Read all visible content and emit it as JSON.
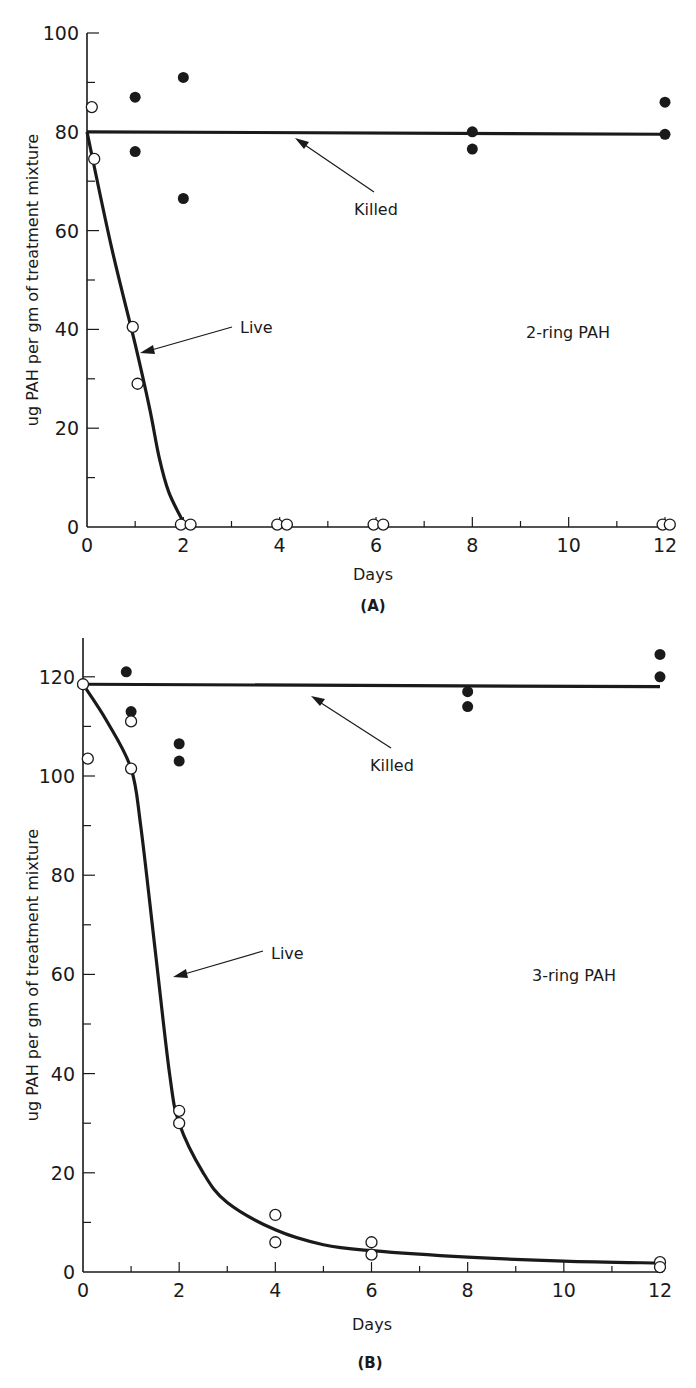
{
  "chart_data": [
    {
      "panel": "(A)",
      "type": "scatter",
      "title": "2-ring PAH",
      "xlabel": "Days",
      "ylabel": "ug PAH per gm of treatment mixture",
      "xlim": [
        0,
        12
      ],
      "ylim": [
        0,
        100
      ],
      "x_ticks": [
        0,
        2,
        4,
        6,
        8,
        10,
        12
      ],
      "y_ticks": [
        0,
        20,
        40,
        60,
        80,
        100
      ],
      "grid": false,
      "annotations": [
        "Killed",
        "Live",
        "2-ring PAH"
      ],
      "series": [
        {
          "name": "Killed",
          "marker": "filled-circle",
          "points": [
            [
              1,
              87
            ],
            [
              1,
              76
            ],
            [
              2,
              91
            ],
            [
              2,
              66.5
            ],
            [
              8,
              80
            ],
            [
              8,
              76.5
            ],
            [
              12,
              86
            ],
            [
              12,
              79.5
            ]
          ],
          "fit_line": [
            [
              0,
              80
            ],
            [
              12,
              79.5
            ]
          ]
        },
        {
          "name": "Live",
          "marker": "open-circle",
          "points": [
            [
              0.1,
              85
            ],
            [
              0.15,
              74.5
            ],
            [
              0.95,
              40.5
            ],
            [
              1.05,
              29
            ],
            [
              1.95,
              0.5
            ],
            [
              2.15,
              0.5
            ],
            [
              3.95,
              0.5
            ],
            [
              4.15,
              0.5
            ],
            [
              5.95,
              0.5
            ],
            [
              6.15,
              0.5
            ],
            [
              11.95,
              0.5
            ],
            [
              12.1,
              0.5
            ]
          ],
          "fit_line": [
            [
              0,
              80
            ],
            [
              0.5,
              57
            ],
            [
              1,
              37
            ],
            [
              1.3,
              24
            ],
            [
              1.5,
              14
            ],
            [
              1.7,
              7
            ],
            [
              2,
              1
            ]
          ]
        }
      ]
    },
    {
      "panel": "(B)",
      "type": "scatter",
      "title": "3-ring PAH",
      "xlabel": "Days",
      "ylabel": "ug PAH per gm of treatment mixture",
      "xlim": [
        0,
        12
      ],
      "ylim": [
        0,
        128
      ],
      "x_ticks": [
        0,
        2,
        4,
        6,
        8,
        10,
        12
      ],
      "y_ticks": [
        0,
        20,
        40,
        60,
        80,
        100,
        120
      ],
      "grid": false,
      "annotations": [
        "Killed",
        "Live",
        "3-ring PAH"
      ],
      "series": [
        {
          "name": "Killed",
          "marker": "filled-circle",
          "points": [
            [
              0.9,
              121
            ],
            [
              1,
              113
            ],
            [
              2,
              106.5
            ],
            [
              2,
              103
            ],
            [
              8,
              117
            ],
            [
              8,
              114
            ],
            [
              12,
              124.5
            ],
            [
              12,
              120
            ]
          ],
          "fit_line": [
            [
              0,
              118.5
            ],
            [
              12,
              118
            ]
          ]
        },
        {
          "name": "Live",
          "marker": "open-circle",
          "points": [
            [
              0,
              118.5
            ],
            [
              0.1,
              103.5
            ],
            [
              1,
              111
            ],
            [
              1,
              101.5
            ],
            [
              2,
              32.5
            ],
            [
              2,
              30
            ],
            [
              4,
              11.5
            ],
            [
              4,
              6
            ],
            [
              6,
              6
            ],
            [
              6,
              3.5
            ],
            [
              12,
              2
            ],
            [
              12,
              1
            ]
          ],
          "fit_line": [
            [
              0,
              118.5
            ],
            [
              0.5,
              111
            ],
            [
              1,
              101.5
            ],
            [
              1.2,
              90
            ],
            [
              1.5,
              65
            ],
            [
              1.8,
              40
            ],
            [
              2,
              30
            ],
            [
              2.5,
              20
            ],
            [
              3,
              14
            ],
            [
              4,
              8.5
            ],
            [
              5,
              5.5
            ],
            [
              6,
              4.3
            ],
            [
              8,
              3
            ],
            [
              10,
              2.2
            ],
            [
              12,
              1.8
            ]
          ]
        }
      ]
    }
  ],
  "labels": {
    "a": {
      "panel": "(A)",
      "xlabel": "Days",
      "ylabel": "ug PAH per gm of treatment mixture",
      "killed": "Killed",
      "live": "Live",
      "title": "2-ring PAH",
      "x_ticks": [
        "0",
        "2",
        "4",
        "6",
        "8",
        "10",
        "12"
      ],
      "y_ticks": [
        "0",
        "20",
        "40",
        "60",
        "80",
        "100"
      ]
    },
    "b": {
      "panel": "(B)",
      "xlabel": "Days",
      "ylabel": "ug PAH per gm of treatment mixture",
      "killed": "Killed",
      "live": "Live",
      "title": "3-ring PAH",
      "x_ticks": [
        "0",
        "2",
        "4",
        "6",
        "8",
        "10",
        "12"
      ],
      "y_ticks": [
        "0",
        "20",
        "40",
        "60",
        "80",
        "100",
        "120"
      ]
    }
  },
  "colors": {
    "ink": "#1a1a1a",
    "background": "#ffffff"
  }
}
